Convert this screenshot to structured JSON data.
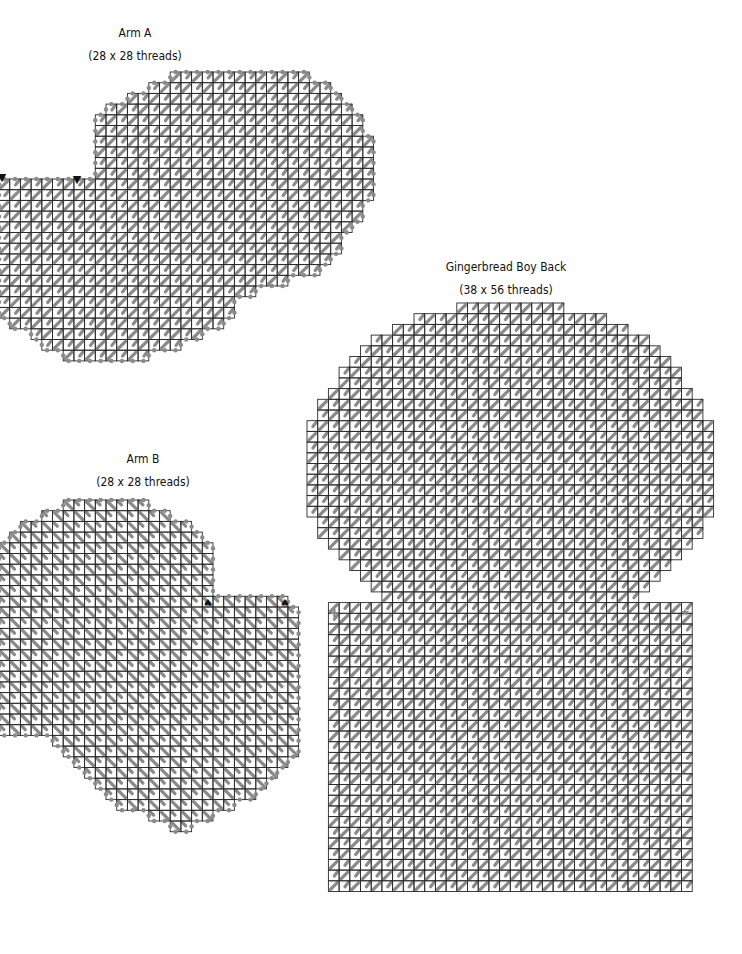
{
  "pieces": [
    {
      "id": "arm-a",
      "title": "Arm A",
      "size": "(28 x 28 threads)",
      "label_x": 135,
      "label_y": 26,
      "origin_x": -1,
      "origin_y": 72,
      "cell": 10.7,
      "stitch_direction": "up-right",
      "overcast": true,
      "rows": [
        [
          16,
          29
        ],
        [
          14,
          31
        ],
        [
          12,
          32
        ],
        [
          10,
          33
        ],
        [
          9,
          34
        ],
        [
          9,
          34
        ],
        [
          9,
          35
        ],
        [
          9,
          35
        ],
        [
          9,
          35
        ],
        [
          9,
          35
        ],
        [
          0,
          35
        ],
        [
          0,
          35
        ],
        [
          0,
          34
        ],
        [
          0,
          34
        ],
        [
          0,
          33
        ],
        [
          0,
          32
        ],
        [
          0,
          32
        ],
        [
          0,
          31
        ],
        [
          0,
          30
        ],
        [
          0,
          27
        ],
        [
          0,
          24
        ],
        [
          0,
          22
        ],
        [
          0,
          22
        ],
        [
          1,
          21
        ],
        [
          3,
          19
        ],
        [
          4,
          17
        ],
        [
          6,
          14
        ]
      ],
      "markers": [
        {
          "symbol": "▼",
          "x": 77,
          "y": 183,
          "name": "triangle-marker"
        },
        {
          "symbol": "▼",
          "x": 2,
          "y": 181,
          "name": "triangle-marker"
        }
      ]
    },
    {
      "id": "arm-b",
      "title": "Arm B",
      "size": "(28 x 28 threads)",
      "label_x": 143,
      "label_y": 452,
      "origin_x": -1,
      "origin_y": 500,
      "cell": 10.7,
      "stitch_direction": "down-right",
      "overcast": true,
      "rows": [
        [
          6,
          14
        ],
        [
          4,
          16
        ],
        [
          2,
          18
        ],
        [
          1,
          19
        ],
        [
          0,
          20
        ],
        [
          0,
          20
        ],
        [
          0,
          20
        ],
        [
          0,
          20
        ],
        [
          0,
          20
        ],
        [
          0,
          27
        ],
        [
          0,
          28
        ],
        [
          0,
          28
        ],
        [
          0,
          28
        ],
        [
          0,
          28
        ],
        [
          0,
          28
        ],
        [
          0,
          28
        ],
        [
          0,
          28
        ],
        [
          0,
          28
        ],
        [
          0,
          28
        ],
        [
          0,
          28
        ],
        [
          0,
          28
        ],
        [
          0,
          28
        ],
        [
          5,
          28
        ],
        [
          6,
          28
        ],
        [
          7,
          27
        ],
        [
          8,
          26
        ],
        [
          9,
          25
        ],
        [
          10,
          24
        ],
        [
          11,
          22
        ],
        [
          14,
          20
        ],
        [
          16,
          18
        ]
      ],
      "markers": [
        {
          "symbol": "♠",
          "x": 208,
          "y": 607,
          "name": "spade-marker"
        },
        {
          "symbol": "♠",
          "x": 285,
          "y": 607,
          "name": "spade-marker"
        }
      ]
    },
    {
      "id": "gingerbread-boy-back",
      "title": "Gingerbread Boy Back",
      "size": "(38 x 56 threads)",
      "label_x": 506,
      "label_y": 260,
      "origin_x": 307,
      "origin_y": 303,
      "cell": 10.7,
      "stitch_direction": "up-right",
      "overcast": false,
      "rows": [
        [
          14,
          24
        ],
        [
          10,
          28
        ],
        [
          8,
          30
        ],
        [
          6,
          32
        ],
        [
          5,
          33
        ],
        [
          4,
          34
        ],
        [
          3,
          35
        ],
        [
          3,
          35
        ],
        [
          2,
          36
        ],
        [
          1,
          37
        ],
        [
          1,
          37
        ],
        [
          0,
          38
        ],
        [
          0,
          38
        ],
        [
          0,
          38
        ],
        [
          0,
          38
        ],
        [
          0,
          38
        ],
        [
          0,
          38
        ],
        [
          0,
          38
        ],
        [
          0,
          38
        ],
        [
          0,
          38
        ],
        [
          1,
          37
        ],
        [
          1,
          37
        ],
        [
          2,
          36
        ],
        [
          3,
          35
        ],
        [
          4,
          34
        ],
        [
          5,
          33
        ],
        [
          6,
          32
        ],
        [
          7,
          31
        ],
        [
          2,
          36
        ],
        [
          2,
          36
        ],
        [
          2,
          36
        ],
        [
          2,
          36
        ],
        [
          2,
          36
        ],
        [
          2,
          36
        ],
        [
          2,
          36
        ],
        [
          2,
          36
        ],
        [
          2,
          36
        ],
        [
          2,
          36
        ],
        [
          2,
          36
        ],
        [
          2,
          36
        ],
        [
          2,
          36
        ],
        [
          2,
          36
        ],
        [
          2,
          36
        ],
        [
          2,
          36
        ],
        [
          2,
          36
        ],
        [
          2,
          36
        ],
        [
          2,
          36
        ],
        [
          2,
          36
        ],
        [
          2,
          36
        ],
        [
          2,
          36
        ],
        [
          2,
          36
        ],
        [
          2,
          36
        ],
        [
          2,
          36
        ],
        [
          2,
          36
        ],
        [
          2,
          36
        ]
      ],
      "markers": [
        {
          "symbol": "✚",
          "x": 334,
          "y": 617,
          "name": "cross-marker"
        },
        {
          "symbol": "★",
          "x": 685,
          "y": 616,
          "name": "star-marker"
        }
      ]
    }
  ],
  "colors": {
    "grid": "#2a2a2a",
    "stitch": "#8a8a8a",
    "overcast": "#8a8a8a",
    "text": "#111111"
  }
}
